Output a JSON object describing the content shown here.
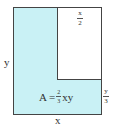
{
  "diagram": {
    "colors": {
      "fill": "#c9f1f5",
      "stroke": "#444444",
      "inner_fill": "#ffffff"
    },
    "outer_rect": {
      "x": 13,
      "y": 7,
      "w": 88,
      "h": 107
    },
    "inner_rect": {
      "x": 57,
      "y": 7,
      "w": 44,
      "h": 72
    },
    "labels": {
      "left_side": "y",
      "bottom_side": "x",
      "inner_top": {
        "num": "x",
        "den": "2"
      },
      "right_lower": {
        "num": "y",
        "den": "3"
      },
      "area": {
        "prefix": "A =",
        "num": "2",
        "den": "3",
        "suffix": "xy"
      }
    }
  }
}
